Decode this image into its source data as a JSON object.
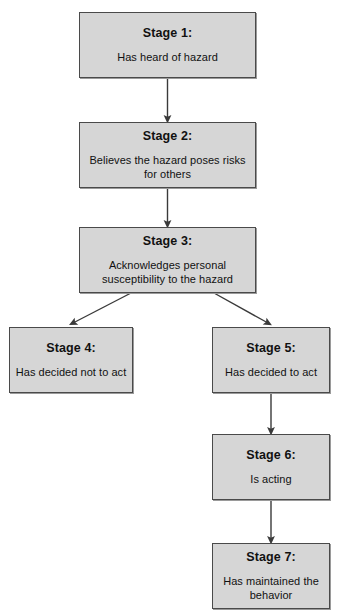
{
  "diagram": {
    "type": "flowchart",
    "orientation": "top-to-bottom",
    "background_color": "#ffffff",
    "node_fill_color": "#d6d6d6",
    "node_border_color": "#4a4a4a",
    "connector_color": "#3a3a3a",
    "nodes": [
      {
        "id": "stage1",
        "title": "Stage 1:",
        "body": "Has heard of hazard",
        "x": 79,
        "y": 12,
        "w": 177,
        "h": 66
      },
      {
        "id": "stage2",
        "title": "Stage 2:",
        "body": "Believes the hazard poses risks for others",
        "x": 79,
        "y": 122,
        "w": 177,
        "h": 66
      },
      {
        "id": "stage3",
        "title": "Stage 3:",
        "body": "Acknowledges personal susceptibility to the hazard",
        "x": 79,
        "y": 227,
        "w": 177,
        "h": 66
      },
      {
        "id": "stage4",
        "title": "Stage 4:",
        "body": "Has decided not to act",
        "x": 9,
        "y": 327,
        "w": 124,
        "h": 66
      },
      {
        "id": "stage5",
        "title": "Stage 5:",
        "body": "Has decided to act",
        "x": 212,
        "y": 327,
        "w": 118,
        "h": 66
      },
      {
        "id": "stage6",
        "title": "Stage 6:",
        "body": "Is acting",
        "x": 212,
        "y": 434,
        "w": 118,
        "h": 66
      },
      {
        "id": "stage7",
        "title": "Stage 7:",
        "body": "Has maintained the behavior",
        "x": 212,
        "y": 543,
        "w": 118,
        "h": 66
      }
    ],
    "edges": [
      {
        "id": "e1",
        "from": "stage1",
        "to": "stage2",
        "style": "straight-vertical"
      },
      {
        "id": "e2",
        "from": "stage2",
        "to": "stage3",
        "style": "straight-vertical"
      },
      {
        "id": "e3",
        "from": "stage3",
        "to": "stage4",
        "style": "diagonal-left"
      },
      {
        "id": "e4",
        "from": "stage3",
        "to": "stage5",
        "style": "diagonal-right"
      },
      {
        "id": "e5",
        "from": "stage5",
        "to": "stage6",
        "style": "straight-vertical"
      },
      {
        "id": "e6",
        "from": "stage6",
        "to": "stage7",
        "style": "straight-vertical"
      }
    ]
  }
}
